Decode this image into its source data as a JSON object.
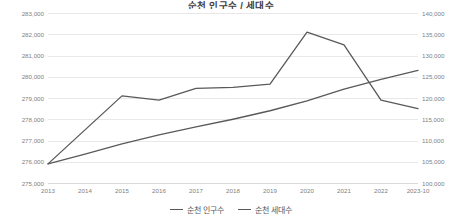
{
  "chart_data": {
    "type": "line",
    "title": "순천 인구수 / 세대수",
    "xlabel": "",
    "ylabel": "",
    "grid": true,
    "legend_position": "bottom",
    "categories": [
      "2013",
      "2014",
      "2015",
      "2016",
      "2017",
      "2018",
      "2019",
      "2020",
      "2021",
      "2022",
      "2023-10"
    ],
    "axes": {
      "left": {
        "name": "순천 인구수",
        "min": 275000,
        "max": 283000,
        "step": 1000,
        "ticks": [
          "275,000",
          "276,000",
          "277,000",
          "278,000",
          "279,000",
          "280,000",
          "281,000",
          "282,000",
          "283,000"
        ]
      },
      "right": {
        "name": "순천 세대수",
        "min": 100000,
        "max": 140000,
        "step": 5000,
        "ticks": [
          "100,000",
          "105,000",
          "110,000",
          "115,000",
          "120,000",
          "125,000",
          "130,000",
          "135,000",
          "140,000"
        ]
      }
    },
    "series": [
      {
        "name": "순천 인구수",
        "axis": "left",
        "color": "#595959",
        "values": [
          275900,
          277500,
          279100,
          278900,
          279450,
          279500,
          279650,
          282100,
          281500,
          278900,
          278500
        ]
      },
      {
        "name": "순천 세대수",
        "axis": "right",
        "color": "#595959",
        "values": [
          104500,
          106800,
          109200,
          111300,
          113200,
          115000,
          117000,
          119300,
          122100,
          124400,
          126500
        ]
      }
    ]
  },
  "legend": {
    "items": [
      {
        "label": "순천 인구수"
      },
      {
        "label": "순천 세대수"
      }
    ]
  }
}
